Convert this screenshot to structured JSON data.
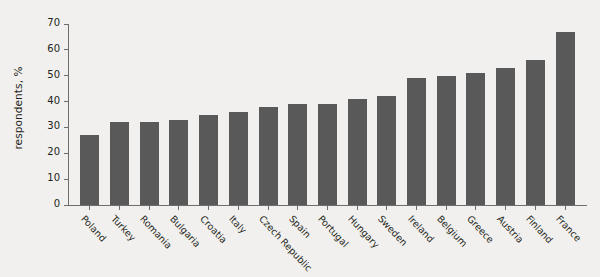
{
  "chart_data": {
    "type": "bar",
    "title": "",
    "xlabel": "",
    "ylabel": "respondents, %",
    "ylim": [
      0,
      70
    ],
    "yticks": [
      0,
      10,
      20,
      30,
      40,
      50,
      60,
      70
    ],
    "grid": false,
    "legend": null,
    "bar_color": "#595959",
    "background_color": "#f1f0ee",
    "axis_color": "#6d6d6d",
    "categories": [
      "Poland",
      "Turkey",
      "Romania",
      "Bulgaria",
      "Croatia",
      "Italy",
      "Czech Republic",
      "Spain",
      "Portugal",
      "Hungary",
      "Sweden",
      "Ireland",
      "Belgium",
      "Greece",
      "Austria",
      "Finland",
      "France"
    ],
    "values": [
      27,
      32,
      32,
      33,
      35,
      36,
      38,
      39,
      39,
      41,
      42,
      49,
      50,
      51,
      53,
      56,
      67
    ]
  }
}
